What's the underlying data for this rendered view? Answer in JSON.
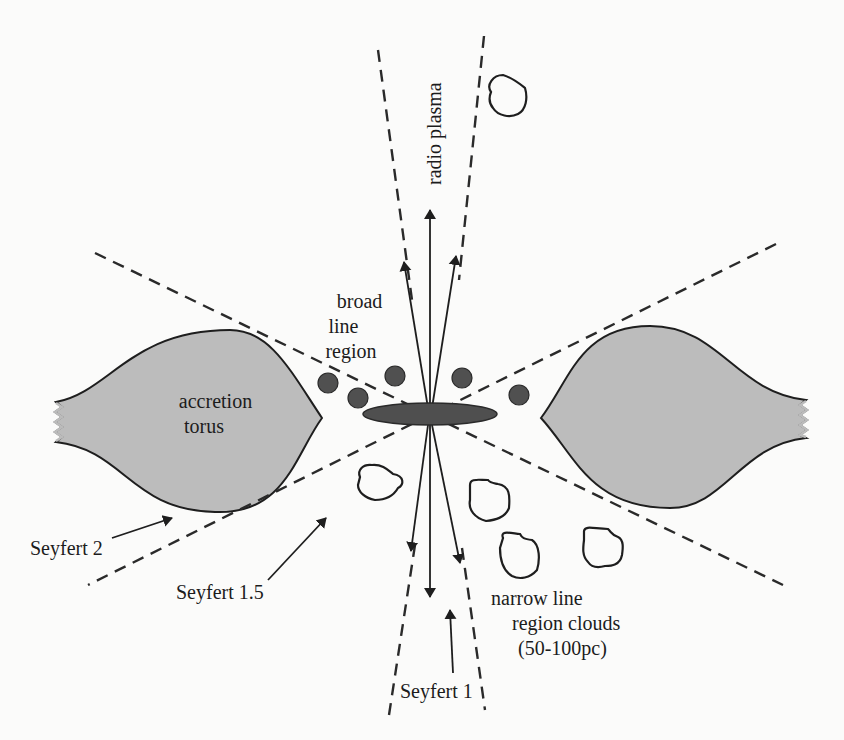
{
  "figure": {
    "colors": {
      "background": "#fbfbfa",
      "torus_fill": "#bcbcbc",
      "outline": "#1e1e1e",
      "accretion_disk": "#4f4f4f",
      "broad_line_clouds": "#505050",
      "narrow_line_clouds_fill": "#ffffff"
    }
  },
  "labels": {
    "radio_plasma": "radio plasma",
    "broad_line_region": [
      "broad",
      "line",
      "region"
    ],
    "accretion_torus": [
      "accretion",
      "torus"
    ],
    "seyfert_2": "Seyfert 2",
    "seyfert_1_5": "Seyfert 1.5",
    "seyfert_1": "Seyfert 1",
    "narrow_line_region": [
      "narrow  line",
      "region  clouds",
      "(50-100pc)"
    ]
  },
  "components": {
    "broad_line_cloud_count": 5,
    "narrow_line_cloud_count": 5,
    "jet_arrow_count_up": 3,
    "jet_arrow_count_down": 3
  }
}
